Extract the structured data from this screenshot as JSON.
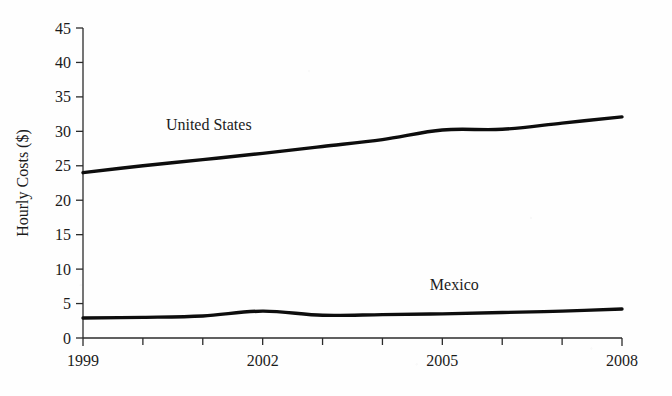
{
  "chart_data": {
    "type": "line",
    "title": "",
    "xlabel": "",
    "ylabel": "Hourly Costs ($)",
    "x": [
      1999,
      2000,
      2001,
      2002,
      2003,
      2004,
      2005,
      2006,
      2007,
      2008
    ],
    "xtick_labels": [
      "1999",
      "2002",
      "2005",
      "2008"
    ],
    "xtick_values": [
      1999,
      2002,
      2005,
      2008
    ],
    "xlim": [
      1999,
      2008
    ],
    "ylim": [
      0,
      45
    ],
    "ytick_labels": [
      "0",
      "5",
      "10",
      "15",
      "20",
      "25",
      "30",
      "35",
      "40",
      "45"
    ],
    "ytick_values": [
      0,
      5,
      10,
      15,
      20,
      25,
      30,
      35,
      40,
      45
    ],
    "grid": false,
    "legend_position": "inline-annotations",
    "series": [
      {
        "name": "United States",
        "color": "#0d0d0d",
        "values": [
          24.0,
          25.0,
          25.9,
          26.8,
          27.8,
          28.8,
          30.2,
          30.3,
          31.2,
          32.1
        ],
        "annotation": {
          "text": "United States",
          "x": 2001.1,
          "y": 30.2
        }
      },
      {
        "name": "Mexico",
        "color": "#0d0d0d",
        "values": [
          2.9,
          3.0,
          3.2,
          3.9,
          3.3,
          3.4,
          3.5,
          3.7,
          3.9,
          4.2
        ],
        "annotation": {
          "text": "Mexico",
          "x": 2005.2,
          "y": 7.0
        }
      }
    ]
  }
}
